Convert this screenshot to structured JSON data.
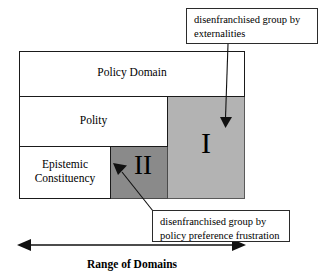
{
  "diagram": {
    "title": "Range of Domains",
    "nested_boxes": [
      {
        "id": "policy-domain",
        "label": "Policy Domain"
      },
      {
        "id": "polity",
        "label": "Polity"
      },
      {
        "id": "epistemic-constituency",
        "label": "Epistemic\nConstituency"
      }
    ],
    "regions": [
      {
        "id": "region-one",
        "numeral": "I",
        "fill": "#b3b3b3",
        "meaning": "disenfranchised group by externalities"
      },
      {
        "id": "region-two",
        "numeral": "II",
        "fill": "#8a8a8a",
        "meaning": "disenfranchised group by policy preference frustration"
      }
    ],
    "callouts": [
      {
        "id": "callout-externalities",
        "text": "disenfranchised group by\nexternalities"
      },
      {
        "id": "callout-frustration",
        "text": "disenfranchised group by\npolicy preference frustration"
      }
    ],
    "axis": {
      "caption": "Range of Domains",
      "arrow_style": "double-headed"
    },
    "colors": {
      "outline": "#1a1a1a",
      "region_one_fill": "#b3b3b3",
      "region_two_fill": "#8a8a8a",
      "background": "#ffffff",
      "text": "#000000"
    }
  }
}
